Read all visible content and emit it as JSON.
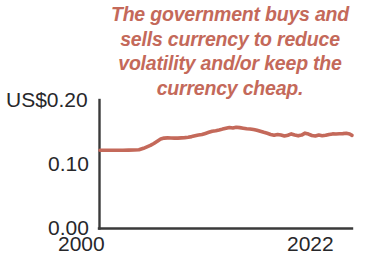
{
  "chart_data": {
    "type": "line",
    "title": "",
    "subtitle": "",
    "annotation": "The government buys and\nsells currency to reduce\nvolatility and/or keep the\ncurrency cheap.",
    "xlabel": "",
    "ylabel": "",
    "ylim": [
      0.0,
      0.2
    ],
    "xlim": [
      2000,
      2022
    ],
    "ytick_labels": [
      "US$0.20",
      "0.10",
      "0.00"
    ],
    "ytick_values": [
      0.2,
      0.1,
      0.0
    ],
    "xtick_labels": [
      "2000",
      "2022"
    ],
    "xtick_values": [
      2000,
      2022
    ],
    "grid": false,
    "legend": null,
    "line_color": "#c4695a",
    "axis_color": "#3a3a3a",
    "label_color": "#27272a",
    "series": [
      {
        "name": "Exchange rate (US$ per unit)",
        "x": [
          2000.0,
          2000.5,
          2001.0,
          2001.5,
          2002.0,
          2002.5,
          2003.0,
          2003.4,
          2003.8,
          2004.1,
          2004.4,
          2004.7,
          2005.0,
          2005.3,
          2005.6,
          2005.9,
          2006.2,
          2006.5,
          2006.8,
          2007.1,
          2007.4,
          2007.7,
          2008.0,
          2008.3,
          2008.6,
          2008.9,
          2009.2,
          2009.5,
          2009.8,
          2010.1,
          2010.4,
          2010.7,
          2011.0,
          2011.3,
          2011.6,
          2011.9,
          2012.2,
          2012.5,
          2012.8,
          2013.1,
          2013.4,
          2013.7,
          2014.0,
          2014.3,
          2014.6,
          2014.9,
          2015.2,
          2015.5,
          2015.8,
          2016.1,
          2016.4,
          2016.7,
          2017.0,
          2017.3,
          2017.6,
          2017.9,
          2018.2,
          2018.5,
          2018.8,
          2019.1,
          2019.4,
          2019.7,
          2020.0,
          2020.3,
          2020.6,
          2020.9,
          2021.2,
          2021.5,
          2021.8,
          2022.0
        ],
        "y": [
          0.1215,
          0.1215,
          0.1215,
          0.1216,
          0.1216,
          0.1217,
          0.1218,
          0.1222,
          0.1245,
          0.1268,
          0.129,
          0.132,
          0.1355,
          0.139,
          0.1405,
          0.1408,
          0.1406,
          0.1404,
          0.1405,
          0.1408,
          0.1412,
          0.1418,
          0.1428,
          0.144,
          0.1452,
          0.1462,
          0.1478,
          0.1495,
          0.1512,
          0.152,
          0.153,
          0.1545,
          0.1558,
          0.157,
          0.1562,
          0.1575,
          0.1568,
          0.156,
          0.1552,
          0.1548,
          0.154,
          0.1528,
          0.1512,
          0.1495,
          0.148,
          0.1462,
          0.145,
          0.1462,
          0.1452,
          0.1438,
          0.145,
          0.147,
          0.1452,
          0.144,
          0.1452,
          0.1482,
          0.1468,
          0.1445,
          0.1438,
          0.1452,
          0.1442,
          0.1448,
          0.1462,
          0.147,
          0.1468,
          0.1472,
          0.1475,
          0.148,
          0.1468,
          0.1448
        ]
      }
    ]
  }
}
